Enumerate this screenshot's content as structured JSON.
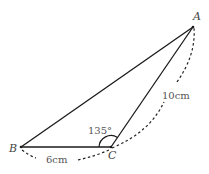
{
  "diagram": {
    "type": "triangle",
    "points": {
      "A": {
        "label": "A",
        "x": 193,
        "y": 27
      },
      "B": {
        "label": "B",
        "x": 21,
        "y": 147
      },
      "C": {
        "label": "C",
        "x": 111,
        "y": 147
      }
    },
    "angle_C_label": "135°",
    "side_BC_label": "6cm",
    "side_CA_label": "10cm",
    "colors": {
      "line": "#1a1a1a",
      "dash": "#222222",
      "text": "#555555"
    }
  }
}
